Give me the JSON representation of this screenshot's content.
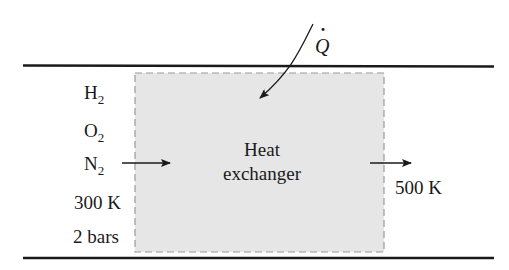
{
  "diagram": {
    "heat_label": "Q",
    "heat_label_dot": "·",
    "box_label_line1": "Heat",
    "box_label_line2": "exchanger",
    "inlet": {
      "species": [
        {
          "symbol": "H",
          "subscript": "2"
        },
        {
          "symbol": "O",
          "subscript": "2"
        },
        {
          "symbol": "N",
          "subscript": "2"
        }
      ],
      "temperature": "300 K",
      "pressure": "2 bars"
    },
    "outlet": {
      "temperature": "500 K"
    },
    "colors": {
      "box_fill": "#e6e6e6",
      "box_border": "#9a9a9a",
      "lines": "#1a1a1a"
    }
  }
}
